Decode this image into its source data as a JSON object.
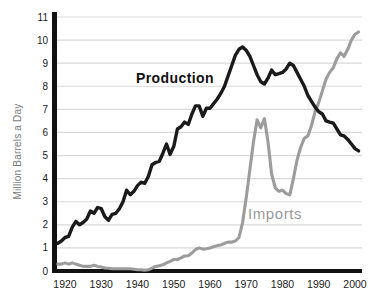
{
  "chart_data": {
    "type": "line",
    "title": "",
    "xlabel": "",
    "ylabel": "Million Barrels a Day",
    "ylim": [
      0,
      11
    ],
    "xlim": [
      1917,
      2002
    ],
    "grid": "horizontal-light",
    "legend_position": "inline-labels-on-plot",
    "y_ticks": [
      0,
      1,
      2,
      3,
      4,
      5,
      6,
      7,
      8,
      9,
      10,
      11
    ],
    "x_ticks": [
      1920,
      1930,
      1940,
      1950,
      1960,
      1970,
      1980,
      1990,
      2000
    ],
    "x": [
      1918,
      1919,
      1920,
      1921,
      1922,
      1923,
      1924,
      1925,
      1926,
      1927,
      1928,
      1929,
      1930,
      1931,
      1932,
      1933,
      1934,
      1935,
      1936,
      1937,
      1938,
      1939,
      1940,
      1941,
      1942,
      1943,
      1944,
      1945,
      1946,
      1947,
      1948,
      1949,
      1950,
      1951,
      1952,
      1953,
      1954,
      1955,
      1956,
      1957,
      1958,
      1959,
      1960,
      1961,
      1962,
      1963,
      1964,
      1965,
      1966,
      1967,
      1968,
      1969,
      1970,
      1971,
      1972,
      1973,
      1974,
      1975,
      1976,
      1977,
      1978,
      1979,
      1980,
      1981,
      1982,
      1983,
      1984,
      1985,
      1986,
      1987,
      1988,
      1989,
      1990,
      1991,
      1992,
      1993,
      1994,
      1995,
      1996,
      1997,
      1998,
      1999,
      2000,
      2001
    ],
    "series": [
      {
        "name": "Production",
        "color": "#1a1a1a",
        "label_color": "#111111",
        "values": [
          1.2,
          1.3,
          1.45,
          1.5,
          1.9,
          2.15,
          2.0,
          2.1,
          2.25,
          2.6,
          2.5,
          2.75,
          2.7,
          2.35,
          2.2,
          2.45,
          2.5,
          2.7,
          3.0,
          3.5,
          3.3,
          3.45,
          3.7,
          3.85,
          3.8,
          4.1,
          4.6,
          4.7,
          4.75,
          5.1,
          5.5,
          5.05,
          5.4,
          6.15,
          6.25,
          6.45,
          6.35,
          6.8,
          7.15,
          7.15,
          6.7,
          7.05,
          7.05,
          7.25,
          7.45,
          7.7,
          8.0,
          8.45,
          8.9,
          9.35,
          9.6,
          9.7,
          9.55,
          9.3,
          8.9,
          8.5,
          8.2,
          8.1,
          8.35,
          8.7,
          8.5,
          8.55,
          8.6,
          8.75,
          9.0,
          8.9,
          8.6,
          8.3,
          8.0,
          7.6,
          7.35,
          7.1,
          6.9,
          6.8,
          6.5,
          6.45,
          6.4,
          6.15,
          5.9,
          5.85,
          5.7,
          5.5,
          5.3,
          5.2
        ]
      },
      {
        "name": "Imports",
        "color": "#9c9c9c",
        "label_color": "#999999",
        "values": [
          0.3,
          0.3,
          0.35,
          0.3,
          0.35,
          0.3,
          0.25,
          0.2,
          0.2,
          0.2,
          0.25,
          0.2,
          0.17,
          0.13,
          0.12,
          0.1,
          0.1,
          0.1,
          0.1,
          0.1,
          0.1,
          0.08,
          0.05,
          0.05,
          0.03,
          0.05,
          0.12,
          0.2,
          0.23,
          0.27,
          0.35,
          0.42,
          0.5,
          0.5,
          0.57,
          0.65,
          0.66,
          0.78,
          0.93,
          1.0,
          0.95,
          0.96,
          1.0,
          1.05,
          1.1,
          1.13,
          1.2,
          1.25,
          1.25,
          1.3,
          1.45,
          2.1,
          3.2,
          4.4,
          5.6,
          6.55,
          6.2,
          6.6,
          5.6,
          4.2,
          3.6,
          3.45,
          3.5,
          3.35,
          3.3,
          4.0,
          4.8,
          5.35,
          5.75,
          5.85,
          6.3,
          6.9,
          7.3,
          7.8,
          8.3,
          8.6,
          8.8,
          9.2,
          9.45,
          9.3,
          9.6,
          10.0,
          10.25,
          10.35
        ]
      }
    ],
    "colors": {
      "grid": "#d9d9d9",
      "axis": "#111111",
      "tick_label": "#1a1a1a",
      "ylabel_text": "#7a7a7a"
    }
  }
}
